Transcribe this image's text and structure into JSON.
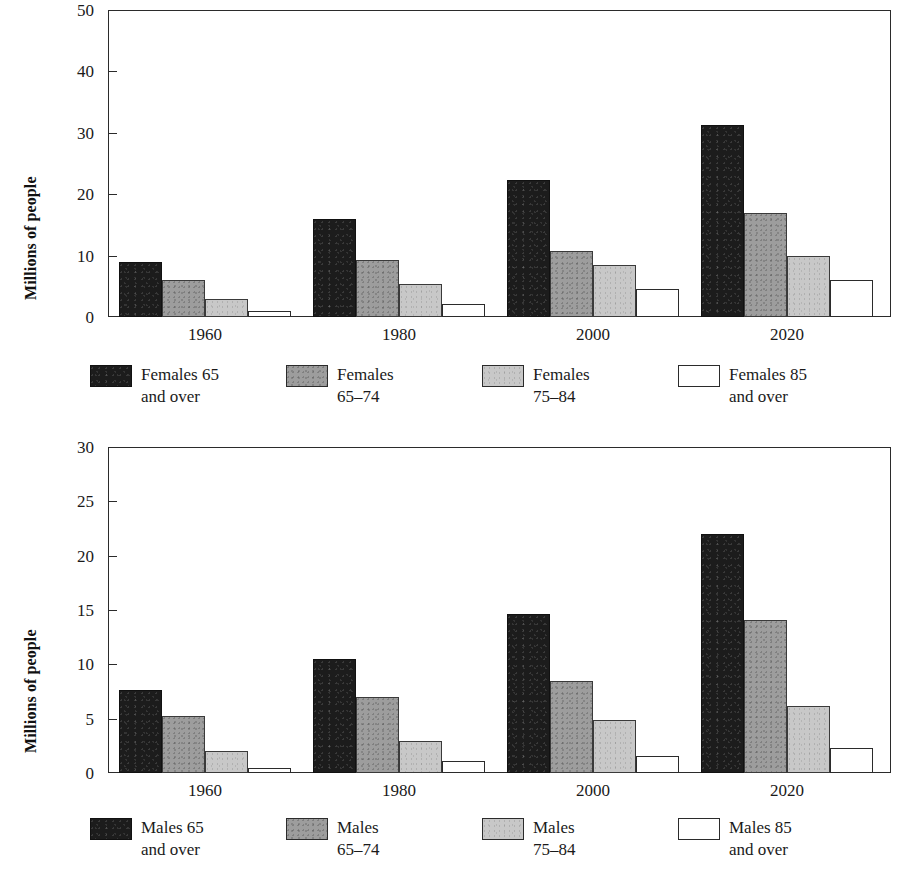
{
  "chart_data": [
    {
      "type": "bar",
      "panel": "top",
      "title": "",
      "xlabel": "",
      "ylabel": "Millions of people",
      "categories": [
        "1960",
        "1980",
        "2000",
        "2020"
      ],
      "ylim": [
        0,
        50
      ],
      "yticks": [
        0,
        10,
        20,
        30,
        40,
        50
      ],
      "ytick_labels": [
        "0",
        "10",
        "20",
        "30",
        "40",
        "50"
      ],
      "grid": false,
      "legend_position": "below",
      "series": [
        {
          "name": "Females 65 and over",
          "swatch": "black",
          "color": "#1c1c1c",
          "values": [
            8.9,
            15.9,
            22.3,
            31.3
          ]
        },
        {
          "name": "Females 65-74",
          "swatch": "dark",
          "color": "#9d9d9d",
          "values": [
            6.1,
            9.3,
            10.8,
            17.0
          ]
        },
        {
          "name": "Females 75-84",
          "swatch": "light",
          "color": "#c8c8c8",
          "values": [
            3.0,
            5.3,
            8.4,
            9.9
          ]
        },
        {
          "name": "Females 85 and over",
          "swatch": "white",
          "color": "#ffffff",
          "values": [
            0.9,
            2.1,
            4.6,
            6.1
          ]
        }
      ],
      "legend": [
        {
          "swatch": "black",
          "label": "Females 65\nand over"
        },
        {
          "swatch": "dark",
          "label": "Females\n65–74"
        },
        {
          "swatch": "light",
          "label": "Females\n75–84"
        },
        {
          "swatch": "white",
          "label": "Females 85\nand over"
        }
      ]
    },
    {
      "type": "bar",
      "panel": "bottom",
      "title": "",
      "xlabel": "",
      "ylabel": "Millions of people",
      "categories": [
        "1960",
        "1980",
        "2000",
        "2020"
      ],
      "ylim": [
        0,
        30
      ],
      "yticks": [
        0,
        5,
        10,
        15,
        20,
        25,
        30
      ],
      "ytick_labels": [
        "0",
        "5",
        "10",
        "15",
        "20",
        "25",
        "30"
      ],
      "grid": false,
      "legend_position": "below",
      "series": [
        {
          "name": "Males 65 and over",
          "swatch": "black",
          "color": "#1c1c1c",
          "values": [
            7.6,
            10.5,
            14.6,
            22.0
          ]
        },
        {
          "name": "Males 65-74",
          "swatch": "dark",
          "color": "#9d9d9d",
          "values": [
            5.2,
            7.0,
            8.5,
            14.1
          ]
        },
        {
          "name": "Males 75-84",
          "swatch": "light",
          "color": "#c8c8c8",
          "values": [
            2.0,
            2.9,
            4.9,
            6.2
          ]
        },
        {
          "name": "Males 85 and over",
          "swatch": "white",
          "color": "#ffffff",
          "values": [
            0.45,
            1.1,
            1.6,
            2.3
          ]
        }
      ],
      "legend": [
        {
          "swatch": "black",
          "label": "Males 65\nand over"
        },
        {
          "swatch": "dark",
          "label": "Males\n65–74"
        },
        {
          "swatch": "light",
          "label": "Males\n75–84"
        },
        {
          "swatch": "white",
          "label": "Males 85\nand over"
        }
      ]
    }
  ]
}
